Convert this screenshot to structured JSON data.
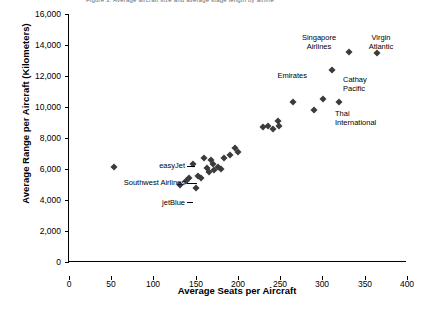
{
  "top_note": "Figure 3.  Average aircraft size and average stage length by airline",
  "chart_data": {
    "type": "scatter",
    "title": "",
    "xlabel": "Average Seats per Aircraft",
    "ylabel": "Average Range per Aircraft (Kilometers)",
    "xlim": [
      0,
      400
    ],
    "ylim": [
      0,
      16000
    ],
    "xticks": [
      0,
      50,
      100,
      150,
      200,
      250,
      300,
      350,
      400
    ],
    "yticks": [
      0,
      2000,
      4000,
      6000,
      8000,
      10000,
      12000,
      14000,
      16000
    ],
    "ytick_labels": [
      "0",
      "2,000",
      "4,000",
      "6,000",
      "8,000",
      "10,000",
      "12,000",
      "14,000",
      "16,000"
    ],
    "grid": false,
    "legend": null,
    "points": [
      {
        "x": 53,
        "y": 6150
      },
      {
        "x": 131,
        "y": 5000
      },
      {
        "x": 139,
        "y": 5200
      },
      {
        "x": 142,
        "y": 5400
      },
      {
        "x": 147,
        "y": 6300
      },
      {
        "x": 150,
        "y": 4750
      },
      {
        "x": 153,
        "y": 5550
      },
      {
        "x": 156,
        "y": 5400
      },
      {
        "x": 160,
        "y": 6700
      },
      {
        "x": 163,
        "y": 6050
      },
      {
        "x": 166,
        "y": 5800
      },
      {
        "x": 168,
        "y": 6550
      },
      {
        "x": 170,
        "y": 6300
      },
      {
        "x": 172,
        "y": 5950
      },
      {
        "x": 176,
        "y": 6100
      },
      {
        "x": 180,
        "y": 6000
      },
      {
        "x": 183,
        "y": 6700
      },
      {
        "x": 190,
        "y": 6900
      },
      {
        "x": 196,
        "y": 7350
      },
      {
        "x": 200,
        "y": 7100
      },
      {
        "x": 230,
        "y": 8700
      },
      {
        "x": 236,
        "y": 8750
      },
      {
        "x": 241,
        "y": 8600
      },
      {
        "x": 247,
        "y": 9100
      },
      {
        "x": 249,
        "y": 8800
      },
      {
        "x": 265,
        "y": 10350
      },
      {
        "x": 290,
        "y": 9800
      },
      {
        "x": 301,
        "y": 10500
      },
      {
        "x": 311,
        "y": 12400
      },
      {
        "x": 320,
        "y": 10300
      },
      {
        "x": 331,
        "y": 13550
      },
      {
        "x": 364,
        "y": 13500
      }
    ],
    "annotations": [
      {
        "label": "easyJet",
        "align": "right"
      },
      {
        "label": "Southwest Airlines",
        "align": "right"
      },
      {
        "label": "jetBlue",
        "align": "right"
      },
      {
        "label": "Emirates",
        "align": "right"
      },
      {
        "label": "Singapore\nAirlines",
        "align": "center"
      },
      {
        "label": "Virgin\nAtlantic",
        "align": "center"
      },
      {
        "label": "Cathay\nPacific",
        "align": "left"
      },
      {
        "label": "Thai\nInternational",
        "align": "left"
      }
    ]
  }
}
